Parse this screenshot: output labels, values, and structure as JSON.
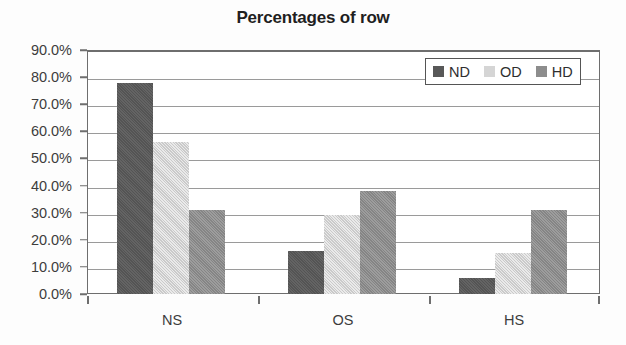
{
  "chart_data": {
    "type": "bar",
    "title": "Percentages of row",
    "xlabel": "",
    "ylabel": "",
    "categories": [
      "NS",
      "OS",
      "HS"
    ],
    "series": [
      {
        "name": "ND",
        "color": "#585858",
        "values": [
          78,
          56,
          6
        ]
      },
      {
        "name": "OD",
        "color": "#d5d5d5",
        "values": [
          56,
          29,
          15
        ]
      },
      {
        "name": "HD",
        "color": "#8d8d8d",
        "values": [
          31,
          38,
          31
        ]
      }
    ],
    "ylim": [
      0,
      90
    ],
    "ytick_values": [
      0,
      10,
      20,
      30,
      40,
      50,
      60,
      70,
      80,
      90
    ],
    "ytick_labels": [
      "0.0%",
      "10.0%",
      "20.0%",
      "30.0%",
      "40.0%",
      "50.0%",
      "60.0%",
      "70.0%",
      "80.0%",
      "90.0%"
    ],
    "grid": "horizontal",
    "legend_position": "top-right-inside",
    "legend_entries": [
      "ND",
      "OD",
      "HD"
    ]
  },
  "series_values": {
    "NS": {
      "ND": 78,
      "OD": 56,
      "HD": 31
    },
    "OS": {
      "ND": 16,
      "OD": 29,
      "HD": 38
    },
    "HS": {
      "ND": 6,
      "OD": 15,
      "HD": 31
    }
  },
  "ytick": {
    "t0": "0.0%",
    "t1": "10.0%",
    "t2": "20.0%",
    "t3": "30.0%",
    "t4": "40.0%",
    "t5": "50.0%",
    "t6": "60.0%",
    "t7": "70.0%",
    "t8": "80.0%",
    "t9": "90.0%"
  },
  "xtick": {
    "c0": "NS",
    "c1": "OS",
    "c2": "HS"
  },
  "legend": {
    "e0": "ND",
    "e1": "OD",
    "e2": "HD"
  }
}
